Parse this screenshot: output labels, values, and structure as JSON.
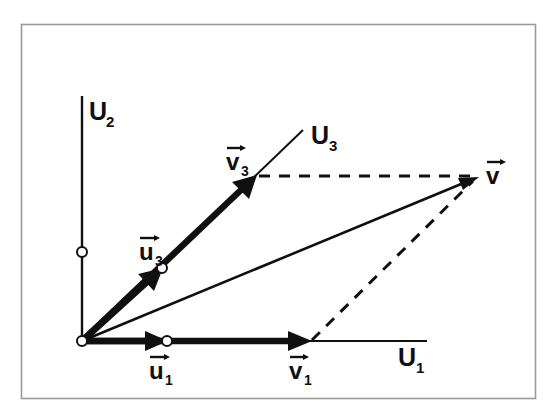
{
  "figure": {
    "background_color": "#ffffff",
    "frame_color": "#9a9a9a",
    "ink_color": "#101010"
  },
  "axes": [
    {
      "id": "U1",
      "label": "U",
      "subscript": "1",
      "label_x": 398,
      "label_y": 364,
      "x1": 82,
      "y1": 341,
      "x2": 427,
      "y2": 341,
      "kind": "horizontal-axis"
    },
    {
      "id": "U2",
      "label": "U",
      "subscript": "2",
      "label_x": 85,
      "label_y": 118,
      "x1": 82,
      "y1": 341,
      "x2": 82,
      "y2": 96,
      "kind": "vertical-axis"
    },
    {
      "id": "U3",
      "label": "U",
      "subscript": "3",
      "label_x": 311,
      "label_y": 142,
      "x1": 255,
      "y1": 176,
      "x2": 302,
      "y2": 131,
      "kind": "oblique-axis"
    }
  ],
  "vectors": [
    {
      "id": "u1",
      "label": "u",
      "subscript": "1",
      "label_x": 150,
      "label_y": 377,
      "x1": 82,
      "y1": 341,
      "x2": 167,
      "y2": 341,
      "style": "bold",
      "endpoint_marker": "open-circle"
    },
    {
      "id": "u3",
      "label": "u",
      "subscript": "3",
      "label_x": 140,
      "label_y": 258,
      "x1": 82,
      "y1": 341,
      "x2": 162,
      "y2": 268,
      "style": "bold",
      "endpoint_marker": "open-circle"
    },
    {
      "id": "v1",
      "label": "v",
      "subscript": "1",
      "label_x": 290,
      "label_y": 377,
      "x1": 82,
      "y1": 341,
      "x2": 311,
      "y2": 341,
      "style": "bold",
      "endpoint_marker": "none"
    },
    {
      "id": "v3",
      "label": "v",
      "subscript": "3",
      "label_x": 227,
      "label_y": 168,
      "x1": 82,
      "y1": 341,
      "x2": 256,
      "y2": 176,
      "style": "bold",
      "endpoint_marker": "none"
    },
    {
      "id": "v",
      "label": "v",
      "subscript": "",
      "label_x": 487,
      "label_y": 184,
      "x1": 82,
      "y1": 341,
      "x2": 479,
      "y2": 177,
      "style": "thin",
      "endpoint_marker": "none"
    }
  ],
  "construction_lines": [
    {
      "id": "v3-to-v",
      "x1": 258,
      "y1": 176,
      "x2": 473,
      "y2": 176,
      "style": "dashed"
    },
    {
      "id": "v1-to-v",
      "x1": 311,
      "y1": 341,
      "x2": 475,
      "y2": 180,
      "style": "dashed"
    }
  ],
  "markers": [
    {
      "id": "origin",
      "x": 82,
      "y": 341,
      "type": "open-circle"
    },
    {
      "id": "u2-unit-on-axis",
      "x": 82,
      "y": 252,
      "type": "open-circle"
    },
    {
      "id": "u1-endpoint",
      "x": 167,
      "y": 341,
      "type": "open-circle"
    },
    {
      "id": "u3-endpoint",
      "x": 162,
      "y": 268,
      "type": "open-circle"
    }
  ],
  "frame": {
    "x": 21,
    "y": 24,
    "width": 514,
    "height": 374
  }
}
